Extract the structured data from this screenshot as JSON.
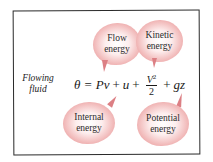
{
  "side_label": {
    "line1": "Flowing",
    "line2": "fluid"
  },
  "equation": {
    "lhs": "θ",
    "eq": "=",
    "term_flow": "Pv",
    "plus1": "+",
    "term_internal": "u",
    "plus2": "+",
    "frac_num": "V",
    "frac_exp": "2",
    "frac_den": "2",
    "plus3": "+",
    "term_potential": "gz"
  },
  "bubbles": {
    "flow": {
      "line1": "Flow",
      "line2": "energy"
    },
    "kinetic": {
      "line1": "Kinetic",
      "line2": "energy"
    },
    "internal": {
      "line1": "Internal",
      "line2": "energy"
    },
    "potential": {
      "line1": "Potential",
      "line2": "energy"
    }
  },
  "colors": {
    "bubble_edge": "#d9737a",
    "bubble_center": "#ffffff",
    "frame": "#2a2a2a"
  }
}
